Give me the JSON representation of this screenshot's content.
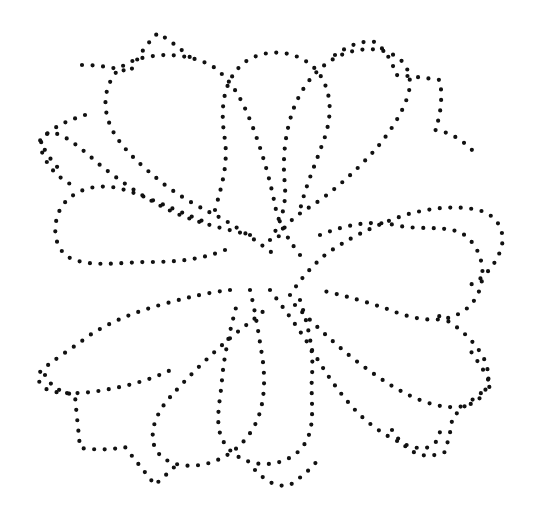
{
  "image": {
    "description": "Dotted-outline quilting pattern: four-way symmetric floral motif with central lobes and diagonal pointed leaves",
    "width": 538,
    "height": 509,
    "background": "#ffffff",
    "dot_color": "#111111",
    "dot_size": 4.2,
    "dot_spacing": 10.5
  },
  "shapes": [
    {
      "name": "top-lobe",
      "d": "M 215 210 C 222 185 228 165 225 140 C 220 110 222 80 245 62 C 270 45 305 52 320 75 C 335 98 330 125 322 145 C 314 168 306 185 300 210"
    },
    {
      "name": "top-left-petal",
      "d": "M 300 255 C 285 235 278 222 275 205 C 270 180 262 150 250 120 C 240 95 230 80 215 68 C 200 58 180 55 165 55 C 145 56 130 60 120 68 C 108 80 100 100 110 125 C 118 145 140 165 165 185 C 185 200 205 210 215 215 C 235 225 255 240 275 255"
    },
    {
      "name": "top-right-petal",
      "d": "M 270 240 C 282 222 286 205 285 185 C 282 160 285 130 295 105 C 305 82 318 68 335 58 C 350 50 365 48 380 50 C 400 55 410 65 410 85 C 408 105 392 130 375 150 C 355 172 330 195 305 210 C 290 220 280 230 275 245"
    },
    {
      "name": "right-lobe",
      "d": "M 320 235 C 345 225 370 220 395 225 C 425 232 455 222 470 240 C 490 262 485 298 462 312 C 440 326 410 318 390 310 C 368 302 345 296 320 290"
    },
    {
      "name": "right-upper-petal",
      "d": "M 290 295 C 300 280 310 268 325 255 C 345 240 375 225 405 215 C 430 208 455 205 478 210 C 495 214 505 228 502 245 C 498 262 485 278 470 285"
    },
    {
      "name": "right-lower-petal",
      "d": "M 295 305 C 310 320 330 340 355 360 C 375 375 395 390 420 400 C 440 408 460 410 475 402 C 490 392 492 372 482 355 C 470 335 450 320 430 312"
    },
    {
      "name": "bottom-lobe",
      "d": "M 300 300 C 308 325 314 350 312 375 C 310 405 318 430 300 450 C 280 470 245 468 228 448 C 212 430 220 405 222 380 C 224 355 230 330 238 300"
    },
    {
      "name": "bottom-left-petal",
      "d": "M 250 290 C 255 310 258 330 262 355 C 266 380 265 410 252 430 C 240 450 220 462 200 465 C 180 468 162 462 155 448 C 148 430 158 410 172 395 C 190 375 215 350 240 330 C 250 322 260 315 270 305"
    },
    {
      "name": "bottom-right-petal",
      "d": "M 270 290 C 285 310 300 330 312 350 C 325 372 340 395 360 415 C 378 432 400 445 418 448 C 430 450 440 442 440 430"
    },
    {
      "name": "left-lobe",
      "d": "M 225 250 C 200 260 175 262 150 262 C 120 262 92 268 70 258 C 52 248 52 222 62 206 C 75 188 100 182 125 190 C 150 198 175 210 205 222"
    },
    {
      "name": "left-upper-petal",
      "d": "M 250 235 C 230 230 205 225 180 215 C 155 205 125 185 100 165 C 85 152 72 140 60 135 C 45 128 38 140 42 152 C 48 168 60 180 78 188"
    },
    {
      "name": "left-lower-petal",
      "d": "M 230 290 C 210 292 185 298 160 305 C 135 312 110 322 90 335 C 70 350 50 362 40 372 C 35 380 42 390 55 392 C 75 395 95 392 115 388 C 135 384 155 378 175 368"
    },
    {
      "name": "top-left-tip",
      "d": "M 82 65 C 100 65 115 68 130 72 C 138 58 145 45 158 33 C 172 42 185 52 195 62"
    },
    {
      "name": "top-right-tip",
      "d": "M 335 55 C 350 45 362 40 375 42 C 385 50 392 60 396 75 C 410 76 425 78 440 80 C 443 100 440 118 435 130 C 450 132 462 140 472 150"
    },
    {
      "name": "left-tip",
      "d": "M 85 115 C 70 120 55 125 40 140 C 45 152 52 162 62 172"
    },
    {
      "name": "bottom-left-tip",
      "d": "M 45 375 C 50 385 58 392 75 395 C 76 410 78 425 80 448 C 95 450 110 450 125 447 C 135 460 145 472 155 485 C 165 475 175 468 180 460"
    },
    {
      "name": "bottom-right-tip",
      "d": "M 392 430 C 405 450 420 462 445 452 C 448 440 452 428 452 418 C 465 405 478 395 492 385 C 485 372 478 362 470 350"
    },
    {
      "name": "bottom-tip",
      "d": "M 255 470 C 265 480 275 488 290 485 C 300 478 310 470 318 460"
    }
  ]
}
